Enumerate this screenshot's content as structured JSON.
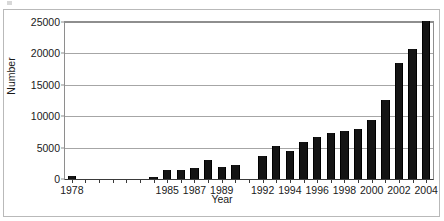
{
  "chart_data": {
    "type": "bar",
    "title": "",
    "xlabel": "Year",
    "ylabel": "Number",
    "ylim": [
      0,
      25000
    ],
    "yticks": [
      0,
      5000,
      10000,
      15000,
      20000,
      25000
    ],
    "ytick_labels": [
      "0",
      "5000",
      "10000",
      "15000",
      "20000",
      "25000"
    ],
    "grid": true,
    "legend": false,
    "categories": [
      "1978",
      "1979",
      "1980",
      "1981",
      "1982",
      "1983",
      "1984",
      "1985",
      "1986",
      "1987",
      "1988",
      "1989",
      "1990",
      "1991",
      "1992",
      "1993",
      "1994",
      "1995",
      "1996",
      "1997",
      "1998",
      "1999",
      "2000",
      "2001",
      "2002",
      "2003",
      "2004"
    ],
    "values": [
      500,
      0,
      0,
      0,
      0,
      0,
      400,
      1500,
      1500,
      1700,
      3100,
      1900,
      2200,
      0,
      3700,
      5300,
      4400,
      5900,
      6700,
      7300,
      7600,
      8000,
      9400,
      12600,
      18400,
      20700,
      25100
    ],
    "visible_categories": [
      "1978",
      "1984",
      "1985",
      "1986",
      "1987",
      "1988",
      "1989",
      "1990",
      "1992",
      "1993",
      "1994",
      "1995",
      "1996",
      "1997",
      "1998",
      "1999",
      "2000",
      "2001",
      "2002",
      "2003",
      "2004"
    ],
    "xtick_labels": [
      "1978",
      "1985",
      "1987",
      "1989",
      "1992",
      "1994",
      "1996",
      "1998",
      "2000",
      "2002",
      "2004"
    ],
    "bar_color": "#141414",
    "grid_color": "#a6a6a6",
    "axis_color": "#3a3a3a",
    "bar_count": 27
  }
}
